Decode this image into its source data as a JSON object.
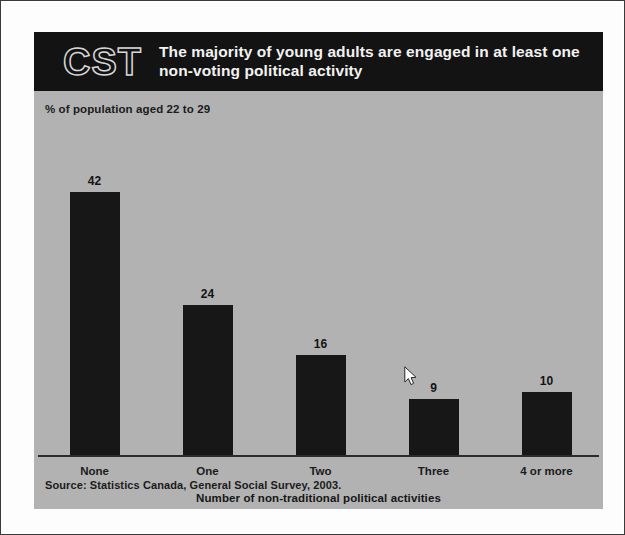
{
  "header": {
    "logo_text": "CST",
    "logo_icon": "cst-wordmark",
    "title": "The majority of young adults are engaged in at least one non-voting political activity"
  },
  "axis_caption": "% of population aged 22 to 29",
  "source": "Source: Statistics Canada, General Social Survey, 2003.",
  "cursor": {
    "icon": "arrow-pointer-cursor",
    "x": 404,
    "y": 366
  },
  "colors": {
    "panel_background": "#b2b2b2",
    "header_band": "#131313",
    "bar_fill": "#171717",
    "text": "#1b1b1b",
    "header_text": "#f2f2f2",
    "mat": "#fdfdfd"
  },
  "chart_data": {
    "type": "bar",
    "title": "The majority of young adults are engaged in at least one non-voting political activity",
    "subtitle": "% of population aged 22 to 29",
    "categories": [
      "None",
      "One",
      "Two",
      "Three",
      "4 or more"
    ],
    "values": [
      42,
      24,
      16,
      9,
      10
    ],
    "value_labels": [
      "42",
      "24",
      "16",
      "9",
      "10"
    ],
    "xlabel": "Number of non-traditional political activities",
    "ylabel": "% of population aged 22 to 29",
    "ylim": [
      0,
      48
    ],
    "grid": false,
    "legend": "none",
    "source": "Source: Statistics Canada, General Social Survey, 2003."
  }
}
